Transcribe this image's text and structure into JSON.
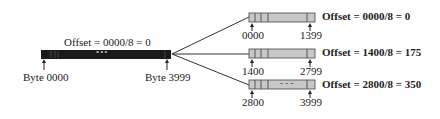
{
  "original": {
    "offset_label": "Offset = 0000/8 = 0",
    "start_label": "Byte 0000",
    "end_label": "Byte 3999",
    "ellipsis": "•••"
  },
  "fragments": [
    {
      "start": "0000",
      "end": "1399",
      "offset_label": "Offset = 0000/8 = 0",
      "ellipsis": ""
    },
    {
      "start": "1400",
      "end": "2799",
      "offset_label": "Offset = 1400/8 = 175",
      "ellipsis": ""
    },
    {
      "start": "2800",
      "end": "3999",
      "offset_label": "Offset = 2800/8 = 350",
      "ellipsis": "- - -"
    }
  ],
  "colors": {
    "original_bar": "#1a1a1a",
    "fragment_fill": "#c8c8c8",
    "line": "#333333"
  }
}
